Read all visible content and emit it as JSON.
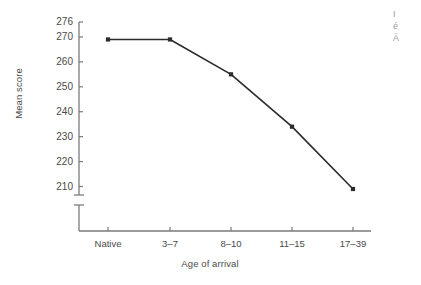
{
  "chart_data": {
    "type": "line",
    "title": "",
    "subtitle": "",
    "xlabel": "Age of arrival",
    "ylabel": "Mean score",
    "categories": [
      "Native",
      "3–7",
      "8–10",
      "11–15",
      "17–39"
    ],
    "values": [
      269,
      269,
      255,
      234,
      209
    ],
    "series": [
      {
        "name": "Mean score",
        "values": [
          269,
          269,
          255,
          234,
          209
        ]
      }
    ],
    "ylim": [
      206,
      276
    ],
    "yticks": [
      210,
      220,
      230,
      240,
      250,
      260,
      270,
      276
    ],
    "ytick_labels": [
      "210",
      "220",
      "230",
      "240",
      "250",
      "260",
      "270",
      "276"
    ],
    "xtick_labels": [
      "Native",
      "3–7",
      "8–10",
      "11–15",
      "17–39"
    ],
    "axis_break": true,
    "axis_break_note": "y-axis broken below 210",
    "grid": false,
    "legend": false,
    "legend_position": "none",
    "marker": "square",
    "line_color": "#2b2b2b",
    "marker_color": "#2b2b2b",
    "axis_color": "#7a7a7a",
    "text_color": "#4a4a4a",
    "background": "#ffffff",
    "annotations": []
  },
  "edge_fragments": {
    "line1": "I",
    "line2": "é",
    "line3": "Ä"
  }
}
